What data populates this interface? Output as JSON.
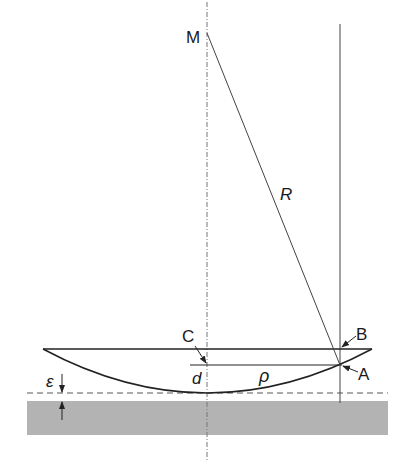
{
  "figure": {
    "labels": {
      "center": "M",
      "radius": "R",
      "point_c": "C",
      "point_b": "B",
      "point_a": "A",
      "sag": "d",
      "ring_radius": "ρ",
      "gap": "ε"
    },
    "colors": {
      "line": "#333333",
      "plate": "#b3b3b3",
      "axis": "#777777"
    }
  }
}
